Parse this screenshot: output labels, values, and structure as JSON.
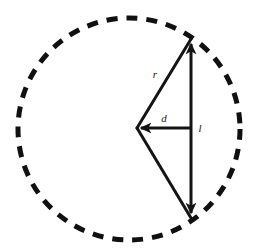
{
  "figure": {
    "background_color": "#ffffff",
    "stroke_color": "#141414",
    "dash_color": "#101010",
    "width": 256,
    "height": 252
  },
  "circle": {
    "name": "dashed-circle",
    "center_x": 129,
    "center_y": 129,
    "radius": 111,
    "stroke_width": 5,
    "dash_pattern": "11 9",
    "style": "dashed"
  },
  "points": {
    "center": {
      "label": "O",
      "x": 137,
      "y": 128
    },
    "top": {
      "label": "A",
      "x": 191,
      "y": 39
    },
    "bottom": {
      "label": "B",
      "x": 191,
      "y": 218
    },
    "midpoint": {
      "label": "M",
      "x": 191,
      "y": 128
    }
  },
  "segments": [
    {
      "name": "radius-upper",
      "from": "center",
      "to": "top",
      "label": "r",
      "label_x": 155,
      "label_y": 78,
      "stroke_width": 3,
      "arrow": "none"
    },
    {
      "name": "radius-lower",
      "from": "center",
      "to": "bottom",
      "label": "",
      "stroke_width": 3,
      "arrow": "none"
    },
    {
      "name": "apothem-distance",
      "from": "center",
      "to": "midpoint",
      "label": "d",
      "label_x": 164,
      "label_y": 122,
      "stroke_width": 3,
      "arrow": "start"
    },
    {
      "name": "chord-length",
      "from": "top",
      "to": "bottom",
      "label": "l",
      "label_x": 200,
      "label_y": 132,
      "stroke_width": 3,
      "arrow": "both"
    }
  ],
  "labels": {
    "radius": "r",
    "distance": "d",
    "chord": "l"
  }
}
